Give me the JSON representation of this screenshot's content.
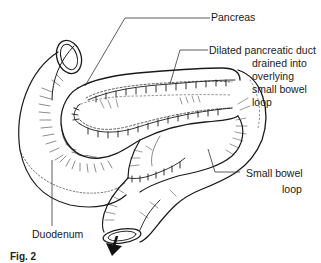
{
  "figure": {
    "caption": "Fig. 2",
    "labels": {
      "pancreas": "Pancreas",
      "duct_line1": "Dilated pancreatic duct",
      "duct_line2": "drained into",
      "duct_line3": "overlying",
      "duct_line4": "small bowel",
      "duct_line5": "loop",
      "small_bowel_line1": "Small bowel",
      "small_bowel_line2": "loop",
      "duodenum": "Duodenum"
    },
    "colors": {
      "ink": "#1a1a1a",
      "background": "#ffffff"
    }
  }
}
